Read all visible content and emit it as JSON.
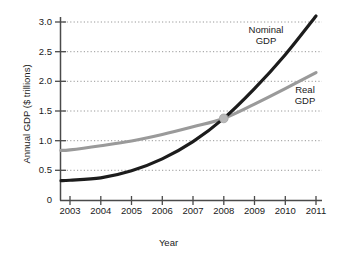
{
  "chart_data": {
    "type": "line",
    "title": "",
    "xlabel": "Year",
    "ylabel": "Annual GDP ($ trillions)",
    "x": [
      2003,
      2004,
      2005,
      2006,
      2007,
      2008,
      2009,
      2010,
      2011
    ],
    "xlim": [
      2002.7,
      2011.1
    ],
    "ylim": [
      0,
      3.2
    ],
    "xticks": [
      "2003",
      "2004",
      "2005",
      "2006",
      "2007",
      "2008",
      "2009",
      "2010",
      "2011"
    ],
    "yticks": [
      "0",
      "0.5",
      "1.0",
      "1.5",
      "2.0",
      "2.5",
      "3.0"
    ],
    "ytick_values": [
      0,
      0.5,
      1.0,
      1.5,
      2.0,
      2.5,
      3.0
    ],
    "grid": "horizontal-dotted",
    "legend_position": "inline-annotations",
    "series": [
      {
        "name": "Nominal GDP",
        "color": "#1c1c1c",
        "annotation": "Nominal\nGDP",
        "annotation_line1": "Nominal",
        "annotation_line2": "GDP",
        "values": [
          0.34,
          0.38,
          0.5,
          0.7,
          0.99,
          1.38,
          1.88,
          2.45,
          3.1
        ]
      },
      {
        "name": "Real GDP",
        "color": "#9a9a9a",
        "annotation": "Real\nGDP",
        "annotation_line1": "Real",
        "annotation_line2": "GDP",
        "values": [
          0.85,
          0.92,
          1.0,
          1.11,
          1.24,
          1.38,
          1.62,
          1.88,
          2.15
        ]
      }
    ],
    "intersection": {
      "x": 2008,
      "y": 1.38,
      "marker_color": "#b8b8b8"
    },
    "axis_color": "#4a4a4a",
    "grid_color": "#8c8c8c",
    "background_color": "#ffffff"
  }
}
